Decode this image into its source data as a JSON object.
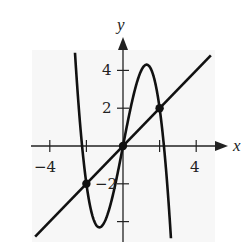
{
  "chart_data": {
    "type": "line",
    "title": "",
    "xlabel": "x",
    "ylabel": "y",
    "xlim": [
      -5,
      5
    ],
    "ylim": [
      -5,
      5.5
    ],
    "grid": false,
    "x_ticks": [
      -4,
      -2,
      2,
      4
    ],
    "x_tick_labels": [
      "−4",
      "4"
    ],
    "y_ticks": [
      -4,
      -2,
      2,
      4
    ],
    "y_tick_labels": [
      "4",
      "2",
      "−2"
    ],
    "series": [
      {
        "name": "cubic",
        "expression": "y = -x^3 + 5x",
        "x": [
          -2.5,
          -2,
          -1.29,
          0,
          1.29,
          2,
          2.7
        ],
        "y": [
          3.1,
          -2,
          -4.3,
          0,
          4.3,
          2,
          -6.2
        ]
      },
      {
        "name": "line",
        "expression": "y = x",
        "x": [
          -4.8,
          4.8
        ],
        "y": [
          -4.8,
          4.8
        ]
      }
    ],
    "points": [
      {
        "x": -2,
        "y": -2
      },
      {
        "x": 0,
        "y": 0
      },
      {
        "x": 2,
        "y": 2
      }
    ],
    "legend": []
  },
  "labels": {
    "x_axis": "x",
    "y_axis": "y",
    "x_neg4": "−4",
    "x_pos4": "4",
    "y_pos4": "4",
    "y_pos2": "2",
    "y_neg2": "−2"
  }
}
